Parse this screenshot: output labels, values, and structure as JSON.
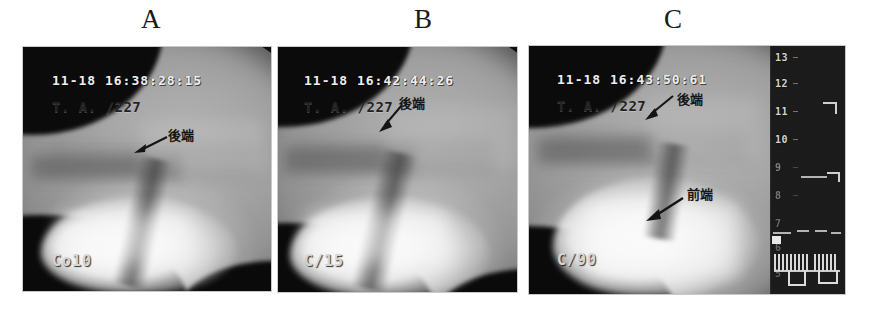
{
  "figure": {
    "caption_letters": [
      "A",
      "B",
      "C"
    ],
    "background_color": "#ffffff",
    "panel_count": 3
  },
  "panels": [
    {
      "letter": "A",
      "timestamp": "11-18 16:38:28:15",
      "case_id": "T. A. /227",
      "corner_code": "Co10",
      "annotations": [
        {
          "text": "後端",
          "meaning": "posterior-end",
          "arrow": "left"
        }
      ],
      "has_sidebar": false
    },
    {
      "letter": "B",
      "timestamp": "11-18 16:42:44:26",
      "case_id": "T. A. /227",
      "corner_code": "C/15",
      "annotations": [
        {
          "text": "後端",
          "meaning": "posterior-end",
          "arrow": "down-left"
        }
      ],
      "has_sidebar": false
    },
    {
      "letter": "C",
      "timestamp": "11-18 16:43:50:61",
      "case_id": "T. A. /227",
      "corner_code": "C/90",
      "annotations": [
        {
          "text": "後端",
          "meaning": "posterior-end",
          "arrow": "down-left"
        },
        {
          "text": "前端",
          "meaning": "anterior-end",
          "arrow": "down-left"
        }
      ],
      "has_sidebar": true,
      "sidebar": {
        "scale_labels": [
          "13",
          "12",
          "11",
          "10",
          "9",
          "8",
          "7",
          "6",
          "5"
        ],
        "scale_top_value": "13",
        "scale_bottom_value": "5"
      }
    }
  ],
  "colors": {
    "page_background": "#ffffff",
    "panel_border": "#c9c9c9",
    "panel_dark": "#0b0b0b",
    "overlay_text_light": "#f2f2f2",
    "overlay_text_dark": "#1f1f1f",
    "sidebar_background": "#191919",
    "sidebar_text": "#d2d2d2"
  }
}
